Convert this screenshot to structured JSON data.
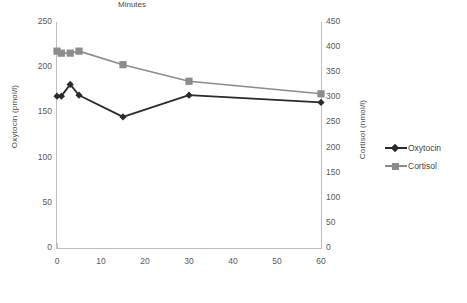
{
  "chart_data": {
    "type": "line",
    "title": "",
    "xlabel": "Minutes",
    "x": [
      0,
      1,
      3,
      5,
      15,
      30,
      60
    ],
    "xlim": [
      0,
      60
    ],
    "xticks": [
      "0",
      "10",
      "20",
      "30",
      "40",
      "50",
      "60"
    ],
    "grid": false,
    "legend_position": "right",
    "series": [
      {
        "name": "Oxytocin",
        "axis": "left",
        "ylabel": "Oxytocin (pmol/l)",
        "ylim": [
          0,
          250
        ],
        "yticks": [
          "0",
          "50",
          "100",
          "150",
          "200",
          "250"
        ],
        "color": "#2b2b2b",
        "marker": "diamond",
        "values": [
          168,
          168,
          181,
          169,
          145,
          169,
          161
        ]
      },
      {
        "name": "Cortisol",
        "axis": "right",
        "ylabel": "Cortisol (nmol/l)",
        "ylim": [
          0,
          450
        ],
        "yticks": [
          "0",
          "50",
          "100",
          "150",
          "200",
          "250",
          "300",
          "350",
          "400",
          "450"
        ],
        "color": "#8c8c8c",
        "marker": "square",
        "values": [
          392,
          388,
          388,
          392,
          365,
          332,
          307
        ]
      }
    ]
  },
  "legend": {
    "items": [
      {
        "label": "Oxytocin"
      },
      {
        "label": "Cortisol"
      }
    ]
  }
}
